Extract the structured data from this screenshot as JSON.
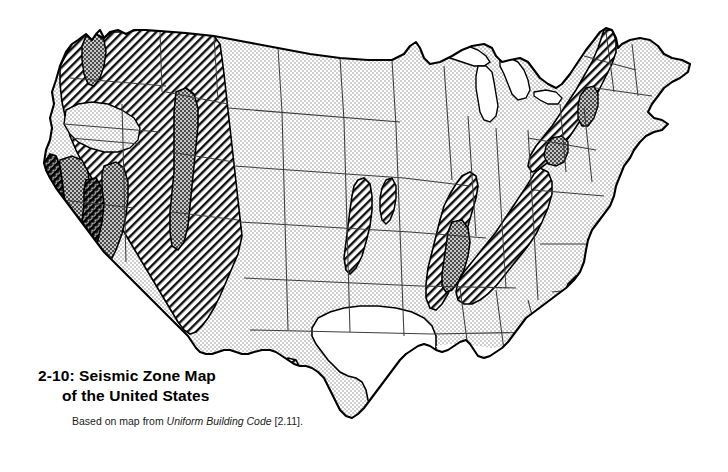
{
  "figure": {
    "number": "2-10:",
    "title_line1": "2-10: Seismic Zone Map",
    "title_line2": "of the United States",
    "source_prefix": "Based on map from",
    "source_italic": "Uniform Building Code",
    "source_reference": "[2.11]."
  },
  "map": {
    "name": "seismic-zone-map-united-states",
    "region": "Contiguous United States",
    "projection_note": "conterminous 48 states outline with state boundaries"
  },
  "zones": [
    {
      "id": "zone-0",
      "label": "Zone 0",
      "pattern": "white",
      "fill": "#ffffff",
      "description": "No damage",
      "regions": [
        "Southern and central Texas",
        "Peninsular Florida",
        "Great Lakes water bodies"
      ]
    },
    {
      "id": "zone-1",
      "label": "Zone 1",
      "pattern": "light-stipple",
      "fill": "#d9d9d9",
      "description": "Minor damage",
      "regions": [
        "Great Plains",
        "Midwest",
        "Mid-Atlantic",
        "Gulf Coast",
        "Northern Florida"
      ]
    },
    {
      "id": "zone-2",
      "label": "Zone 2",
      "pattern": "diagonal-hatch",
      "fill": "#ffffff",
      "description": "Moderate damage",
      "regions": [
        "Interior West",
        "Nevada",
        "Arizona",
        "Rio Grande rift",
        "New England",
        "Appalachian belt"
      ]
    },
    {
      "id": "zone-3",
      "label": "Zone 3",
      "pattern": "medium-stipple",
      "fill": "#8a8a8a",
      "description": "Major damage",
      "regions": [
        "Puget Sound",
        "Wasatch Front",
        "Central California",
        "New Madrid",
        "Charleston South Carolina"
      ]
    },
    {
      "id": "zone-4",
      "label": "Zone 4",
      "pattern": "dark-hatch-crosshatch",
      "fill": "#2b2b2b",
      "description": "Greatest damage",
      "regions": [
        "Coastal California",
        "San Andreas fault corridor"
      ]
    }
  ],
  "colors": {
    "outline": "#000000",
    "state_border": "#555555",
    "light_stipple": "#d9d9d9",
    "medium_stipple": "#8a8a8a",
    "dark_zone": "#2b2b2b",
    "background": "#ffffff"
  }
}
